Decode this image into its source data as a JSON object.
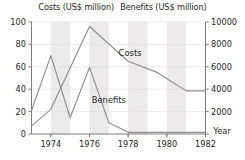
{
  "header": {
    "left_title": "Costs (US$ million)",
    "right_title": "Benefits (US$ million)"
  },
  "axis": {
    "left_ticks": [
      "0",
      "20",
      "40",
      "60",
      "80",
      "100"
    ],
    "right_ticks": [
      "2000",
      "4000",
      "6000",
      "8000",
      "10000"
    ],
    "x_ticks": [
      "1974",
      "1976",
      "1978",
      "1980",
      "1982"
    ],
    "x_axis_label": "Year"
  },
  "series_labels": {
    "costs": "Costs",
    "benefits": "Benefits"
  },
  "colors": {
    "line": "#8e8e8e",
    "axis": "#6f6f6f",
    "band": "#eceaea",
    "text": "#231f20",
    "background": "#ffffff"
  },
  "chart_data": {
    "type": "line",
    "xlabel": "Year",
    "ylabel": "Costs (US$ million)",
    "y2label": "Benefits (US$ million)",
    "xlim": [
      1973,
      1982
    ],
    "ylim": [
      0,
      100
    ],
    "y2lim": [
      0,
      10000
    ],
    "yticks": [
      0,
      20,
      40,
      60,
      80,
      100
    ],
    "y2ticks": [
      0,
      2000,
      4000,
      6000,
      8000,
      10000
    ],
    "xticks": [
      1974,
      1976,
      1978,
      1980,
      1982
    ],
    "grid": false,
    "legend": "inline-annotations",
    "series": [
      {
        "name": "Costs",
        "axis": "left",
        "units": "US$ million",
        "x": [
          1973,
          1974,
          1976,
          1978,
          1979.5,
          1981,
          1982
        ],
        "values": [
          7,
          22,
          96,
          65,
          55,
          38.5,
          38.5
        ]
      },
      {
        "name": "Benefits",
        "axis": "right",
        "units": "US$ million",
        "x": [
          1973,
          1974,
          1975,
          1976,
          1977,
          1978,
          1982
        ],
        "values": [
          2100,
          7000,
          1450,
          5950,
          1000,
          150,
          150
        ]
      }
    ],
    "annotations": [
      {
        "text": "Costs",
        "x": 1978.1,
        "y": 72
      },
      {
        "text": "Benefits",
        "x": 1977.0,
        "y": 30
      },
      {
        "text": "Year",
        "x": 1982.4,
        "y": 3
      }
    ]
  }
}
